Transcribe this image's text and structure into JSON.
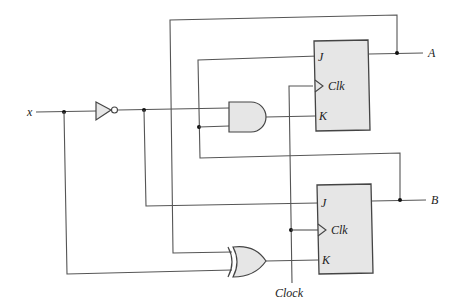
{
  "diagram": {
    "type": "sequential-circuit",
    "inputs": [
      {
        "name": "input-x",
        "label": "x"
      }
    ],
    "clock": {
      "label": "Clock"
    },
    "outputs": [
      {
        "name": "output-a",
        "label": "A"
      },
      {
        "name": "output-b",
        "label": "B"
      }
    ],
    "gates": [
      {
        "name": "not-gate",
        "type": "NOT",
        "input": "x"
      },
      {
        "name": "and-gate",
        "type": "AND",
        "inputs": [
          "x'",
          "B"
        ],
        "output_to": "FF-A K"
      },
      {
        "name": "xor-gate",
        "type": "XOR",
        "inputs": [
          "A",
          "x"
        ],
        "output_to": "FF-B K"
      }
    ],
    "flip_flops": [
      {
        "name": "flip-flop-a",
        "pins": {
          "j": "J",
          "clk": "Clk",
          "k": "K"
        },
        "connections": {
          "J": "B",
          "K": "x' AND B",
          "Q": "A"
        }
      },
      {
        "name": "flip-flop-b",
        "pins": {
          "j": "J",
          "clk": "Clk",
          "k": "K"
        },
        "connections": {
          "J": "x'",
          "K": "A XOR x",
          "Q": "B"
        }
      }
    ],
    "colors": {
      "wire": "#555555",
      "gate_fill": "#e6e6e6",
      "outline": "#444444",
      "junction": "#111111"
    }
  }
}
